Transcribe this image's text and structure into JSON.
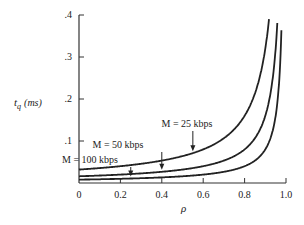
{
  "chart_data": {
    "type": "line",
    "title": "",
    "xlabel": "ρ",
    "ylabel": "t_q (ms)",
    "ylabel_main": "t",
    "ylabel_sub": "q",
    "ylabel_unit": "(ms)",
    "xlim": [
      0,
      1.0
    ],
    "ylim": [
      0,
      0.4
    ],
    "grid": false,
    "legend": "none (inline annotations with arrows)",
    "x_ticks": [
      "0",
      "0.2",
      "0.4",
      "0.6",
      "0.8",
      "1.0"
    ],
    "y_ticks": [
      ".1",
      ".2",
      ".3",
      ".4"
    ],
    "x": [
      0,
      0.1,
      0.2,
      0.3,
      0.4,
      0.5,
      0.6,
      0.7,
      0.8,
      0.85,
      0.9,
      0.95
    ],
    "series": [
      {
        "name": "M = 25 kbps",
        "values": [
          0.032,
          0.036,
          0.04,
          0.046,
          0.053,
          0.064,
          0.08,
          0.107,
          0.16,
          0.213,
          0.32,
          0.64
        ]
      },
      {
        "name": "M = 50 kbps",
        "values": [
          0.016,
          0.018,
          0.02,
          0.023,
          0.027,
          0.032,
          0.04,
          0.053,
          0.08,
          0.107,
          0.16,
          0.32
        ]
      },
      {
        "name": "M = 100 kbps",
        "values": [
          0.008,
          0.009,
          0.01,
          0.011,
          0.013,
          0.016,
          0.02,
          0.027,
          0.04,
          0.053,
          0.08,
          0.16
        ]
      }
    ],
    "annotations": [
      {
        "text": "M = 25 kbps",
        "arrow_to_x": 0.55
      },
      {
        "text": "M = 50 kbps",
        "arrow_to_x": 0.4
      },
      {
        "text": "M = 100 kbps",
        "arrow_to_x": 0.25
      }
    ]
  }
}
